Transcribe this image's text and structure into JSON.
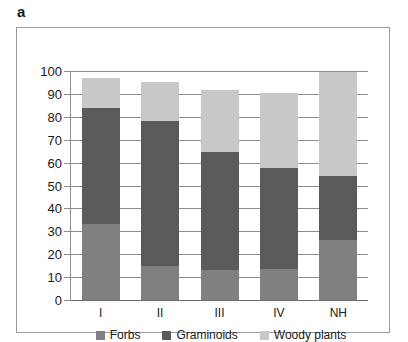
{
  "figure": {
    "panel_letter": "a"
  },
  "chart_data": {
    "type": "bar",
    "stacked": true,
    "title": "",
    "xlabel": "",
    "ylabel": "",
    "categories": [
      "I",
      "II",
      "III",
      "IV",
      "NH"
    ],
    "series": [
      {
        "name": "Forbs",
        "color": "#808080",
        "values": [
          33,
          15,
          13,
          13.5,
          26
        ]
      },
      {
        "name": "Graminoids",
        "color": "#5a5a5a",
        "values": [
          51,
          63,
          51.5,
          44,
          28
        ]
      },
      {
        "name": "Woody plants",
        "color": "#c8c8c8",
        "values": [
          13,
          17,
          27,
          33,
          45.5
        ]
      }
    ],
    "cumulative_tops": [
      {
        "category": "I",
        "forbs_top": 33,
        "graminoids_top": 84,
        "total": 97
      },
      {
        "category": "II",
        "forbs_top": 15,
        "graminoids_top": 78,
        "total": 95
      },
      {
        "category": "III",
        "forbs_top": 13,
        "graminoids_top": 64.5,
        "total": 91.5
      },
      {
        "category": "IV",
        "forbs_top": 13.5,
        "graminoids_top": 57.5,
        "total": 90.5
      },
      {
        "category": "NH",
        "forbs_top": 26,
        "graminoids_top": 54,
        "total": 99.5
      }
    ],
    "ylim": [
      0,
      100
    ],
    "yticks": [
      0,
      10,
      20,
      30,
      40,
      50,
      60,
      70,
      80,
      90,
      100
    ],
    "ytick_labels": [
      "0",
      "10",
      "20",
      "30",
      "40",
      "50",
      "60",
      "70",
      "80",
      "90",
      "100"
    ],
    "grid": true,
    "legend_position": "bottom",
    "legend_entries": [
      "Forbs",
      "Graminoids",
      "Woody plants"
    ]
  }
}
